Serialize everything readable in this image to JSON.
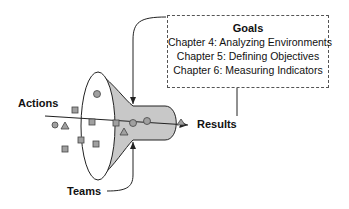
{
  "diagram": {
    "goals": {
      "title": "Goals",
      "items": [
        "Chapter 4: Analyzing Environments",
        "Chapter 5: Defining Objectives",
        "Chapter 6: Measuring Indicators"
      ]
    },
    "labels": {
      "actions": "Actions",
      "results": "Results",
      "teams": "Teams"
    },
    "colors": {
      "funnel_fill": "#c8c8c8",
      "marker_fill": "#a0a0a0",
      "stroke": "#222222"
    }
  }
}
